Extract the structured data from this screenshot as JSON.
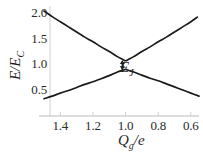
{
  "chart_data": {
    "type": "line",
    "title": "",
    "xlabel": "Q_g/e",
    "ylabel": "E/E_C",
    "xlabel_parts": {
      "main": "Q",
      "sub": "g",
      "rest": "/e"
    },
    "ylabel_parts": {
      "main": "E",
      "slash": "/",
      "second": "E",
      "sub": "C"
    },
    "xlim": [
      1.5,
      0.55
    ],
    "ylim": [
      0.28,
      2.08
    ],
    "x_ticks": [
      1.4,
      1.2,
      1.0,
      0.8,
      0.6
    ],
    "x_tick_labels": [
      "1.4",
      "1.2",
      "1.0",
      "0.8",
      "0.6"
    ],
    "y_ticks": [
      0.5,
      1.0,
      1.5,
      2.0
    ],
    "y_tick_labels": [
      "0.5",
      "1.0",
      "1.5",
      "2.0"
    ],
    "grid": false,
    "legend": null,
    "axis_color": "#cccccc",
    "curve_color": "#1a1a1a",
    "annotations": [
      {
        "name": "energy-gap-marker",
        "label": "E_J",
        "label_main": "E",
        "label_sub": "J",
        "x": 1.02,
        "y_low": 0.9,
        "y_high": 1.07,
        "description": "double-headed vertical arrow marking avoided-crossing gap"
      }
    ],
    "series": [
      {
        "name": "upper-branch",
        "x": [
          1.5,
          1.45,
          1.4,
          1.35,
          1.3,
          1.25,
          1.2,
          1.15,
          1.1,
          1.05,
          1.02,
          1.0,
          0.98,
          0.95,
          0.9,
          0.85,
          0.8,
          0.75,
          0.7,
          0.65,
          0.6,
          0.56
        ],
        "y": [
          2.04,
          1.93,
          1.83,
          1.73,
          1.63,
          1.53,
          1.44,
          1.34,
          1.25,
          1.15,
          1.1,
          1.07,
          1.1,
          1.15,
          1.25,
          1.34,
          1.44,
          1.53,
          1.63,
          1.73,
          1.83,
          1.92
        ]
      },
      {
        "name": "lower-branch",
        "x": [
          1.5,
          1.45,
          1.4,
          1.35,
          1.3,
          1.25,
          1.2,
          1.15,
          1.1,
          1.05,
          1.02,
          1.0,
          0.98,
          0.95,
          0.9,
          0.85,
          0.8,
          0.75,
          0.7,
          0.65,
          0.6,
          0.55
        ],
        "y": [
          0.33,
          0.38,
          0.44,
          0.49,
          0.55,
          0.61,
          0.66,
          0.72,
          0.78,
          0.85,
          0.88,
          0.9,
          0.88,
          0.85,
          0.79,
          0.73,
          0.68,
          0.62,
          0.56,
          0.5,
          0.44,
          0.38
        ]
      }
    ]
  }
}
